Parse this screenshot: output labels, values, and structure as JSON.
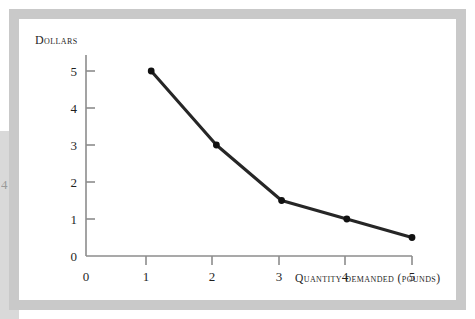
{
  "figure": {
    "background_color": "#ffffff",
    "frame_color": "#c9c9c9",
    "margin_artifact_glyph": "4"
  },
  "chart_data": {
    "type": "line",
    "title": "",
    "xlabel": "Quantity demanded (pounds)",
    "ylabel": "Dollars",
    "x": [
      1,
      2,
      3,
      4,
      5
    ],
    "values": [
      5,
      3,
      1.5,
      1,
      0.5
    ],
    "points": [
      {
        "x": 1,
        "y": 5
      },
      {
        "x": 2,
        "y": 3
      },
      {
        "x": 3,
        "y": 1.5
      },
      {
        "x": 4,
        "y": 1
      },
      {
        "x": 5,
        "y": 0.5
      }
    ],
    "xlim": [
      0,
      5
    ],
    "ylim": [
      0,
      5.4
    ],
    "x_tick_labels": [
      "0",
      "1",
      "2",
      "3",
      "4",
      "5"
    ],
    "y_tick_labels": [
      "0",
      "1",
      "2",
      "3",
      "4",
      "5"
    ],
    "grid": false,
    "legend": null,
    "line_color": "#262626",
    "marker_color": "#111111",
    "axis_color": "#8c8c8c"
  }
}
